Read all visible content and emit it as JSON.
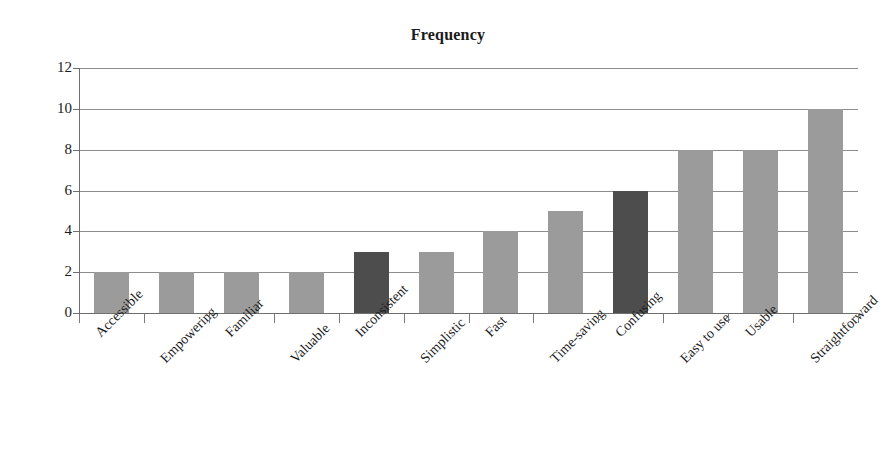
{
  "chart_data": {
    "type": "bar",
    "title": "Frequency",
    "xlabel": "",
    "ylabel": "",
    "ylim": [
      0,
      12
    ],
    "ytick_step": 2,
    "yticks": [
      "0",
      "2",
      "4",
      "6",
      "8",
      "10",
      "12"
    ],
    "grid": true,
    "legend": null,
    "categories": [
      "Accessible",
      "Empowering",
      "Familiar",
      "Valuable",
      "Inconsistent",
      "Simplistic",
      "Fast",
      "Time-saving",
      "Confusing",
      "Easy to use",
      "Usable",
      "Straightforward"
    ],
    "values": [
      2,
      2,
      2,
      2,
      3,
      3,
      4,
      5,
      6,
      8,
      8,
      10
    ],
    "bar_colors": [
      "#9b9b9b",
      "#9b9b9b",
      "#9b9b9b",
      "#9b9b9b",
      "#4d4d4d",
      "#9b9b9b",
      "#9b9b9b",
      "#9b9b9b",
      "#4d4d4d",
      "#9b9b9b",
      "#9b9b9b",
      "#9b9b9b"
    ]
  },
  "colors": {
    "bar_light": "#9b9b9b",
    "bar_dark": "#4d4d4d",
    "grid": "#8d8d8d",
    "axis": "#6f6f6f",
    "text": "#1c1c1c",
    "background": "#ffffff"
  }
}
